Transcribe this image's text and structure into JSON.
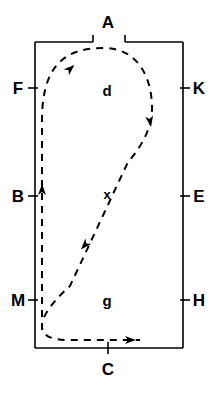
{
  "figure": {
    "title": "",
    "type": "schematic-diagram",
    "background_color": "#ffffff",
    "stroke_color": "#000000"
  },
  "boundary": {
    "name": "rectangle-boundary",
    "x": 35,
    "y": 42,
    "width": 148,
    "height": 306,
    "top_gap": {
      "start_x": 93,
      "end_x": 125,
      "tick_height": 7
    }
  },
  "boundary_labels": [
    {
      "id": "A",
      "text": "A",
      "x": 108,
      "y": 22,
      "side": "top",
      "tick": false
    },
    {
      "id": "F",
      "text": "F",
      "x": 18,
      "y": 88,
      "side": "left",
      "tick": true
    },
    {
      "id": "B",
      "text": "B",
      "x": 18,
      "y": 196,
      "side": "left",
      "tick": true
    },
    {
      "id": "M",
      "text": "M",
      "x": 18,
      "y": 300,
      "side": "left",
      "tick": true
    },
    {
      "id": "K",
      "text": "K",
      "x": 199,
      "y": 88,
      "side": "right",
      "tick": true
    },
    {
      "id": "E",
      "text": "E",
      "x": 199,
      "y": 196,
      "side": "right",
      "tick": true
    },
    {
      "id": "H",
      "text": "H",
      "x": 199,
      "y": 300,
      "side": "right",
      "tick": true
    },
    {
      "id": "C",
      "text": "C",
      "x": 108,
      "y": 369,
      "side": "bottom",
      "tick": true
    }
  ],
  "region_labels": [
    {
      "id": "d",
      "text": "d",
      "x": 107,
      "y": 90
    },
    {
      "id": "g",
      "text": "g",
      "x": 107,
      "y": 300
    }
  ],
  "point_markers": [
    {
      "id": "x",
      "text": "x",
      "x": 107,
      "y": 194
    }
  ],
  "trajectory": {
    "name": "dashed-flow-curve",
    "style": "dashed",
    "dash_pattern": "7 6",
    "stroke_width": 2,
    "path": "M 42 330 L 42 190 L 42 120 C 42 60 70 48 104 48 C 138 48 152 78 152 108 C 152 128 142 146 128 162 L 70 286 C 48 306 42 318 42 326 C 42 336 52 340 68 340 L 140 340",
    "arrows": [
      {
        "id": "arrow-up-left",
        "x": 42,
        "y": 190,
        "angle": -90,
        "note": "upward along left edge near B"
      },
      {
        "id": "arrow-upper-loop",
        "x": 70,
        "y": 69,
        "angle": -42,
        "note": "up-right along top of loop near F/A"
      },
      {
        "id": "arrow-loop-descend",
        "x": 150,
        "y": 121,
        "angle": 80,
        "note": "downward on right of loop"
      },
      {
        "id": "arrow-diagonal",
        "x": 85,
        "y": 245,
        "angle": 132,
        "note": "down-left on diagonal below x"
      },
      {
        "id": "arrow-bottom",
        "x": 130,
        "y": 340,
        "angle": 0,
        "note": "rightward along bottom toward C"
      }
    ]
  }
}
